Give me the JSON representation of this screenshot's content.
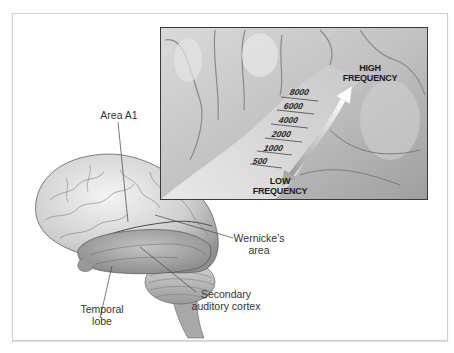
{
  "figure": {
    "colors": {
      "background": "#ffffff",
      "frame_border": "#cfcfcf",
      "inset_border": "#3a3a3a",
      "brain_light": "#e8e8e8",
      "brain_mid": "#b5b5b5",
      "brain_dark": "#7a7a7a",
      "label_text": "#333333"
    }
  },
  "labels": {
    "area_a1": "Area A1",
    "wernicke_line1": "Wernicke's",
    "wernicke_line2": "area",
    "secondary_line1": "Secondary",
    "secondary_line2": "auditory cortex",
    "temporal_line1": "Temporal",
    "temporal_line2": "lobe"
  },
  "inset": {
    "high_line1": "HIGH",
    "high_line2": "FREQUENCY",
    "low_line1": "LOW",
    "low_line2": "FREQUENCY",
    "scale": [
      "8000",
      "6000",
      "4000",
      "2000",
      "1000",
      "500"
    ]
  }
}
